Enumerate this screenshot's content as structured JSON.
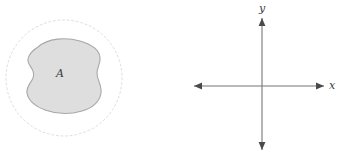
{
  "figure": {
    "background_color": "#ffffff",
    "panels": [
      {
        "id": "region-panel",
        "name": "region-diagram",
        "elements": {
          "dashed_circle": {
            "name": "dashed-boundary-circle",
            "center_x": 64,
            "center_y": 78,
            "radius": 58,
            "stroke_color": "#d8d4d0",
            "stroke_width": 0.8,
            "dash_pattern": "2 2.6",
            "fill": "none"
          },
          "region_blob": {
            "name": "region-blob",
            "fill_color": "#dedede",
            "stroke_color": "#a8a8a8",
            "stroke_width": 1.1,
            "label": "A",
            "label_x": 60,
            "label_y": 77
          }
        }
      },
      {
        "id": "axes-panel",
        "name": "coordinate-axes",
        "elements": {
          "origin_x": 262,
          "origin_y": 86,
          "stroke_color": "#777777",
          "stroke_width": 1.1,
          "x_axis": {
            "name": "x-axis",
            "left_end": 194,
            "right_end": 324,
            "label": "x",
            "label_x": 332,
            "label_y": 89
          },
          "y_axis": {
            "name": "y-axis",
            "top_end": 18,
            "bottom_end": 150,
            "label": "y",
            "label_x": 262,
            "label_y": 12
          },
          "arrowheads": [
            "x-axis-left-arrowhead",
            "x-axis-right-arrowhead",
            "y-axis-top-arrowhead",
            "y-axis-bottom-arrowhead"
          ]
        }
      }
    ]
  }
}
